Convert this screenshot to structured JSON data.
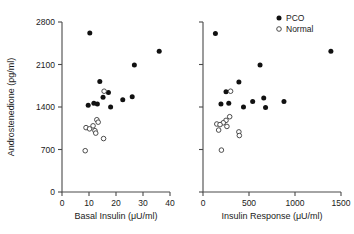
{
  "chart_data": [
    {
      "panel": "left",
      "type": "scatter",
      "title": "",
      "xlabel": "Basal Insulin (μU/ml)",
      "ylabel": "Androstenedione (pg/ml)",
      "xlim": [
        0,
        40
      ],
      "ylim": [
        0,
        2800
      ],
      "xticks": [
        0,
        10,
        20,
        30,
        40
      ],
      "yticks": [
        0,
        700,
        1400,
        2100,
        2800
      ],
      "xticklabels": [
        "0",
        "10",
        "20",
        "30",
        "40"
      ],
      "yticklabels": [
        "0",
        "700",
        "1400",
        "2100",
        "2800"
      ],
      "grid": false,
      "series": [
        {
          "name": "PCO",
          "marker": "filled-circle",
          "color": "#111111",
          "points": [
            [
              10.3,
              2620
            ],
            [
              36.0,
              2320
            ],
            [
              26.8,
              2090
            ],
            [
              14.0,
              1820
            ],
            [
              17.2,
              1640
            ],
            [
              15.2,
              1560
            ],
            [
              11.8,
              1460
            ],
            [
              13.1,
              1450
            ],
            [
              22.5,
              1520
            ],
            [
              26.0,
              1570
            ],
            [
              9.7,
              1430
            ],
            [
              18.0,
              1400
            ]
          ]
        },
        {
          "name": "Normal",
          "marker": "open-circle",
          "color": "#3a3a3a",
          "points": [
            [
              15.6,
              1660
            ],
            [
              12.9,
              1190
            ],
            [
              13.4,
              1150
            ],
            [
              11.5,
              1090
            ],
            [
              8.9,
              1060
            ],
            [
              10.2,
              1040
            ],
            [
              12.2,
              1010
            ],
            [
              12.5,
              970
            ],
            [
              15.4,
              880
            ],
            [
              8.6,
              680
            ]
          ]
        }
      ]
    },
    {
      "panel": "right",
      "type": "scatter",
      "title": "",
      "xlabel": "Insulin Response (μU/ml)",
      "ylabel": "",
      "xlim": [
        0,
        1500
      ],
      "ylim": [
        0,
        2800
      ],
      "xticks": [
        0,
        500,
        1000,
        1500
      ],
      "yticks": [
        0,
        700,
        1400,
        2100,
        2800
      ],
      "xticklabels": [
        "0",
        "500",
        "1000",
        "1500"
      ],
      "yticklabels": [
        "",
        "",
        "",
        "",
        ""
      ],
      "grid": false,
      "series": [
        {
          "name": "PCO",
          "marker": "filled-circle",
          "color": "#111111",
          "points": [
            [
              135,
              2610
            ],
            [
              1390,
              2320
            ],
            [
              620,
              2090
            ],
            [
              390,
              1810
            ],
            [
              250,
              1650
            ],
            [
              660,
              1550
            ],
            [
              880,
              1490
            ],
            [
              540,
              1490
            ],
            [
              195,
              1450
            ],
            [
              280,
              1460
            ],
            [
              440,
              1400
            ],
            [
              680,
              1390
            ]
          ]
        },
        {
          "name": "Normal",
          "marker": "open-circle",
          "color": "#3a3a3a",
          "points": [
            [
              300,
              1660
            ],
            [
              290,
              1240
            ],
            [
              250,
              1180
            ],
            [
              220,
              1140
            ],
            [
              150,
              1120
            ],
            [
              185,
              1110
            ],
            [
              260,
              1080
            ],
            [
              170,
              1020
            ],
            [
              390,
              990
            ],
            [
              395,
              930
            ],
            [
              200,
              690
            ]
          ]
        }
      ]
    }
  ],
  "legend": {
    "position": "top-right-of-right-panel",
    "entries": [
      {
        "label": "PCO",
        "marker": "filled-circle"
      },
      {
        "label": "Normal",
        "marker": "open-circle"
      }
    ]
  }
}
